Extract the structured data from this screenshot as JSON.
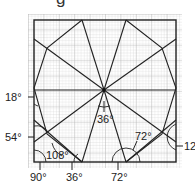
{
  "caption_fragment": "g",
  "diagram": {
    "type": "geometry-construction",
    "grid": {
      "x": 28,
      "y": 14,
      "width": 154,
      "height": 154,
      "minor_step": 3.08,
      "major_every": 5,
      "minor_color": "#c8c8c8",
      "major_color": "#a8a8a8"
    },
    "frame": {
      "x": 34,
      "y": 20,
      "width": 142,
      "height": 142
    },
    "center": {
      "x": 104,
      "y": 90
    },
    "line_color": "#222222",
    "labels": {
      "left_18": "18°",
      "left_54": "54°",
      "bottom_90": "90°",
      "bottom_36": "36°",
      "bottom_72": "72°",
      "inner_108": "108°",
      "center_36": "36°",
      "inner_72": "72°",
      "right_12": "12"
    }
  }
}
